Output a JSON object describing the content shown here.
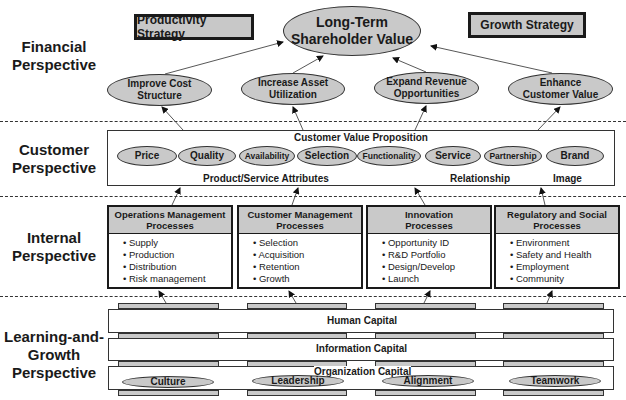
{
  "perspectives": {
    "financial": [
      "Financial",
      "Perspective"
    ],
    "customer": [
      "Customer",
      "Perspective"
    ],
    "internal": [
      "Internal",
      "Perspective"
    ],
    "learning": [
      "Learning-and-",
      "Growth",
      "Perspective"
    ]
  },
  "financial": {
    "productivity_strategy": "Productivity Strategy",
    "growth_strategy": "Growth Strategy",
    "goal": [
      "Long-Term",
      "Shareholder Value"
    ],
    "objectives": [
      [
        "Improve Cost",
        "Structure"
      ],
      [
        "Increase Asset",
        "Utilization"
      ],
      [
        "Expand Revenue",
        "Opportunities"
      ],
      [
        "Enhance",
        "Customer Value"
      ]
    ]
  },
  "customer": {
    "title": "Customer Value Proposition",
    "attributes": [
      "Price",
      "Quality",
      "Availability",
      "Selection",
      "Functionality",
      "Service",
      "Partnership",
      "Brand"
    ],
    "groups": {
      "product_service": "Product/Service Attributes",
      "relationship": "Relationship",
      "image": "Image"
    }
  },
  "internal": {
    "processes": [
      {
        "title": [
          "Operations Management",
          "Processes"
        ],
        "items": [
          "Supply",
          "Production",
          "Distribution",
          "Risk management"
        ]
      },
      {
        "title": [
          "Customer  Management",
          "Processes"
        ],
        "items": [
          "Selection",
          "Acquisition",
          "Retention",
          "Growth"
        ]
      },
      {
        "title": [
          "Innovation",
          "Processes"
        ],
        "items": [
          "Opportunity ID",
          "R&D Portfolio",
          "Design/Develop",
          "Launch"
        ]
      },
      {
        "title": [
          "Regulatory and Social",
          "Processes"
        ],
        "items": [
          "Environment",
          "Safety and Health",
          "Employment",
          "Community"
        ]
      }
    ]
  },
  "learning": {
    "human_capital": "Human Capital",
    "information_capital": "Information Capital",
    "organization_capital": "Organization Capital",
    "organization_items": [
      "Culture",
      "Leadership",
      "Alignment",
      "Teamwork"
    ]
  },
  "colors": {
    "fill_gray": "#c9c9c9",
    "border": "#1a1a1a",
    "background": "#ffffff"
  }
}
